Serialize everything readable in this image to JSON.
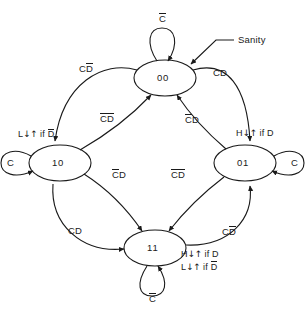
{
  "diagram": {
    "type": "state-transition-diagram",
    "title": "",
    "states": [
      {
        "id": "s00",
        "label": "00",
        "cx": 165,
        "cy": 78,
        "rx": 31,
        "ry": 18
      },
      {
        "id": "s10",
        "label": "10",
        "cx": 60,
        "cy": 163,
        "rx": 31,
        "ry": 18
      },
      {
        "id": "s01",
        "label": "01",
        "cx": 245,
        "cy": 163,
        "rx": 31,
        "ry": 18
      },
      {
        "id": "s11",
        "label": "11",
        "cx": 155,
        "cy": 248,
        "rx": 31,
        "ry": 18
      }
    ],
    "self_loops": [
      {
        "state": "00",
        "label": "C",
        "overbar": "C",
        "position": "top"
      },
      {
        "state": "10",
        "label": "C",
        "overbar": "",
        "position": "left"
      },
      {
        "state": "01",
        "label": "C",
        "overbar": "",
        "position": "right"
      },
      {
        "state": "11",
        "label": "C",
        "overbar": "C",
        "position": "bottom"
      }
    ],
    "transitions": [
      {
        "from": "00",
        "to": "10",
        "label": "CD",
        "overbar": "D",
        "route": "outer-upper-left"
      },
      {
        "from": "00",
        "to": "01",
        "label": "CD",
        "overbar": "",
        "route": "outer-upper-right"
      },
      {
        "from": "10",
        "to": "00",
        "label": "CD",
        "overbar": "CD",
        "route": "inner-upper-left"
      },
      {
        "from": "01",
        "to": "00",
        "label": "CD",
        "overbar": "C",
        "route": "inner-upper-right"
      },
      {
        "from": "10",
        "to": "11",
        "label": "CD",
        "overbar": "C",
        "route": "inner-lower-left"
      },
      {
        "from": "01",
        "to": "11",
        "label": "CD",
        "overbar": "CD",
        "route": "inner-lower-right"
      },
      {
        "from": "10",
        "to": "11",
        "label": "CD",
        "overbar": "",
        "route": "outer-lower-left"
      },
      {
        "from": "11",
        "to": "01",
        "label": "CD",
        "overbar": "D",
        "route": "outer-lower-right"
      }
    ],
    "labels": {
      "outer_upper_left": {
        "text": "CD",
        "bar": "D",
        "x": 79,
        "y": 66
      },
      "outer_upper_right": {
        "text": "CD",
        "bar": "",
        "x": 213,
        "y": 71
      },
      "inner_upper_left": {
        "text": "CD",
        "bar": "CD",
        "x": 101,
        "y": 116
      },
      "inner_upper_right": {
        "text": "CD",
        "bar": "C",
        "x": 186,
        "y": 117
      },
      "inner_lower_left": {
        "text": "CD",
        "bar": "C",
        "x": 113,
        "y": 172
      },
      "inner_lower_right": {
        "text": "CD",
        "bar": "CD",
        "x": 172,
        "y": 172
      },
      "outer_lower_left": {
        "text": "CD",
        "bar": "",
        "x": 68,
        "y": 229
      },
      "outer_lower_right": {
        "text": "CD",
        "bar": "D",
        "x": 222,
        "y": 229
      },
      "loop_top": {
        "text": "C",
        "bar": "C",
        "x": 159,
        "y": 16
      },
      "loop_left": {
        "text": "C",
        "bar": "",
        "x": 7,
        "y": 158
      },
      "loop_right": {
        "text": "C",
        "bar": "",
        "x": 291,
        "y": 158
      },
      "loop_bottom": {
        "text": "C",
        "bar": "C",
        "x": 149,
        "y": 296
      }
    },
    "annotations": [
      {
        "name": "sanity",
        "text": "Sanity",
        "x": 238,
        "y": 42
      }
    ],
    "outputs": [
      {
        "state": "10",
        "lines": [
          {
            "signal": "L",
            "edge": "↓↑",
            "cond": "if D",
            "bar": "D"
          }
        ],
        "x": 19,
        "y": 131
      },
      {
        "state": "01",
        "lines": [
          {
            "signal": "H",
            "edge": "↓↑",
            "cond": "if D",
            "bar": ""
          }
        ],
        "x": 238,
        "y": 131
      },
      {
        "state": "11",
        "lines": [
          {
            "signal": "H",
            "edge": "↓↑",
            "cond": "if D",
            "bar": ""
          },
          {
            "signal": "L",
            "edge": "↓↑",
            "cond": "if D",
            "bar": "D"
          }
        ],
        "x": 182,
        "y": 252
      }
    ],
    "colors": {
      "stroke": "#1a1a1a",
      "text": "#1a1a1a",
      "background": "#ffffff"
    }
  }
}
